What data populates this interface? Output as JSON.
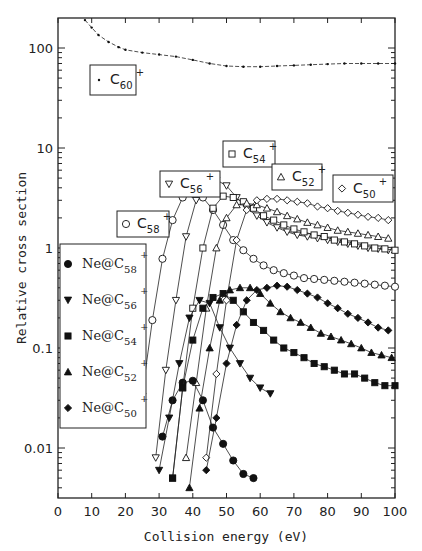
{
  "chart_data": {
    "type": "scatter",
    "title": "",
    "xlabel": "Collision energy (eV)",
    "ylabel": "Relative cross section",
    "xlim": [
      0,
      100
    ],
    "ylim": [
      0.003,
      200
    ],
    "yscale": "log",
    "grid": false,
    "x_ticks": [
      "0",
      "10",
      "20",
      "30",
      "40",
      "50",
      "60",
      "70",
      "80",
      "90",
      "100"
    ],
    "y_ticks": [
      "0.01",
      "0.1",
      "1",
      "10",
      "100"
    ],
    "series": [
      {
        "name": "C60+",
        "marker": "dot",
        "filled": true,
        "line": "dashed-then-solid",
        "x": [
          8,
          10,
          12,
          15,
          18,
          20,
          25,
          30,
          35,
          40,
          45,
          50,
          55,
          60,
          65,
          70,
          75,
          80,
          85,
          90,
          95,
          100
        ],
        "y": [
          190,
          160,
          135,
          115,
          102,
          96,
          90,
          86,
          82,
          76,
          70,
          66,
          65,
          65,
          66,
          67,
          68,
          69,
          70,
          70,
          70,
          70
        ]
      },
      {
        "name": "C58+",
        "marker": "circle",
        "filled": false,
        "x": [
          25,
          28,
          31,
          34,
          37,
          40,
          43,
          46,
          49,
          52,
          55,
          58,
          61,
          64,
          67,
          70,
          73,
          76,
          79,
          82,
          85,
          88,
          91,
          94,
          97,
          100
        ],
        "y": [
          0.035,
          0.19,
          0.78,
          1.9,
          3.2,
          3.5,
          3.2,
          2.4,
          1.7,
          1.2,
          0.95,
          0.78,
          0.67,
          0.6,
          0.56,
          0.53,
          0.5,
          0.49,
          0.48,
          0.47,
          0.46,
          0.45,
          0.44,
          0.43,
          0.42,
          0.41
        ]
      },
      {
        "name": "C56+",
        "marker": "triangle-down",
        "filled": false,
        "x": [
          29,
          32,
          35,
          38,
          41,
          44,
          47,
          50,
          53,
          56,
          59,
          62,
          65,
          68,
          71,
          74,
          77,
          80,
          83,
          86,
          89,
          92,
          95,
          98
        ],
        "y": [
          0.008,
          0.06,
          0.3,
          1.3,
          3.0,
          4.4,
          4.8,
          4.2,
          3.2,
          2.5,
          2.1,
          1.8,
          1.6,
          1.45,
          1.35,
          1.3,
          1.25,
          1.2,
          1.15,
          1.1,
          1.05,
          1.0,
          0.98,
          0.95
        ]
      },
      {
        "name": "C54+",
        "marker": "square",
        "filled": false,
        "x": [
          34,
          37,
          40,
          43,
          46,
          49,
          52,
          55,
          58,
          61,
          64,
          67,
          70,
          73,
          76,
          79,
          82,
          85,
          88,
          91,
          94,
          97,
          100
        ],
        "y": [
          0.005,
          0.04,
          0.25,
          1.0,
          2.5,
          3.3,
          3.2,
          2.9,
          2.5,
          2.1,
          1.9,
          1.7,
          1.55,
          1.45,
          1.35,
          1.3,
          1.2,
          1.15,
          1.1,
          1.05,
          1.0,
          0.98,
          0.95
        ]
      },
      {
        "name": "C52+",
        "marker": "triangle-up",
        "filled": false,
        "x": [
          38,
          41,
          44,
          47,
          50,
          53,
          56,
          59,
          62,
          65,
          68,
          71,
          74,
          77,
          80,
          83,
          86,
          89,
          92,
          95,
          98
        ],
        "y": [
          0.008,
          0.045,
          0.25,
          1.0,
          2.0,
          2.7,
          2.8,
          2.7,
          2.5,
          2.3,
          2.1,
          1.95,
          1.8,
          1.7,
          1.6,
          1.5,
          1.45,
          1.4,
          1.35,
          1.3,
          1.25
        ]
      },
      {
        "name": "C50+",
        "marker": "diamond",
        "filled": false,
        "x": [
          44,
          47,
          50,
          53,
          56,
          59,
          62,
          65,
          68,
          71,
          74,
          77,
          80,
          83,
          86,
          89,
          92,
          95,
          98
        ],
        "y": [
          0.008,
          0.055,
          0.3,
          1.2,
          2.4,
          3.0,
          3.1,
          3.1,
          3.0,
          2.9,
          2.8,
          2.6,
          2.5,
          2.35,
          2.25,
          2.15,
          2.05,
          2.0,
          1.9
        ]
      },
      {
        "name": "Ne@C58+",
        "marker": "circle",
        "filled": true,
        "x": [
          28,
          31,
          34,
          37,
          40,
          43,
          46,
          49,
          52,
          55,
          58
        ],
        "y": [
          0.003,
          0.013,
          0.03,
          0.045,
          0.047,
          0.03,
          0.016,
          0.011,
          0.0075,
          0.0055,
          0.005
        ]
      },
      {
        "name": "Ne@C56+",
        "marker": "triangle-down",
        "filled": true,
        "x": [
          30,
          33,
          36,
          39,
          42,
          45,
          48,
          51,
          54,
          57,
          60,
          63
        ],
        "y": [
          0.006,
          0.02,
          0.07,
          0.2,
          0.3,
          0.28,
          0.16,
          0.1,
          0.07,
          0.05,
          0.04,
          0.035
        ]
      },
      {
        "name": "Ne@C54+",
        "marker": "square",
        "filled": true,
        "x": [
          34,
          37,
          40,
          43,
          46,
          49,
          52,
          55,
          58,
          61,
          64,
          67,
          70,
          73,
          76,
          79,
          82,
          85,
          88,
          91,
          94,
          97,
          100
        ],
        "y": [
          0.005,
          0.04,
          0.12,
          0.25,
          0.32,
          0.35,
          0.3,
          0.23,
          0.18,
          0.15,
          0.12,
          0.1,
          0.09,
          0.08,
          0.07,
          0.065,
          0.06,
          0.055,
          0.055,
          0.05,
          0.045,
          0.042,
          0.042
        ]
      },
      {
        "name": "Ne@C52+",
        "marker": "triangle-up",
        "filled": true,
        "x": [
          39,
          42,
          45,
          48,
          51,
          54,
          57,
          60,
          63,
          66,
          69,
          72,
          75,
          78,
          81,
          84,
          87,
          90,
          93,
          96,
          99
        ],
        "y": [
          0.004,
          0.025,
          0.1,
          0.3,
          0.38,
          0.4,
          0.4,
          0.35,
          0.28,
          0.23,
          0.2,
          0.18,
          0.16,
          0.14,
          0.13,
          0.12,
          0.11,
          0.1,
          0.09,
          0.085,
          0.08
        ]
      },
      {
        "name": "Ne@C50+",
        "marker": "diamond",
        "filled": true,
        "x": [
          44,
          47,
          50,
          53,
          56,
          59,
          62,
          65,
          68,
          71,
          74,
          77,
          80,
          83,
          86,
          89,
          92,
          95,
          98
        ],
        "y": [
          0.006,
          0.02,
          0.07,
          0.17,
          0.3,
          0.38,
          0.4,
          0.42,
          0.41,
          0.38,
          0.35,
          0.32,
          0.28,
          0.25,
          0.22,
          0.2,
          0.18,
          0.16,
          0.15
        ]
      }
    ],
    "annotations": [
      {
        "text": "C60+",
        "box": true,
        "near": [
          12,
          55
        ]
      },
      {
        "text": "C58+",
        "box": true,
        "near": [
          22,
          2
        ]
      },
      {
        "text": "C56+",
        "box": true,
        "near": [
          42,
          9
        ]
      },
      {
        "text": "C54+",
        "box": true,
        "near": [
          56,
          10
        ]
      },
      {
        "text": "C52+",
        "box": true,
        "near": [
          70,
          6
        ]
      },
      {
        "text": "C50+",
        "box": true,
        "near": [
          88,
          4
        ]
      }
    ],
    "legend": {
      "position": "left-middle",
      "entries": [
        "Ne@C58+",
        "Ne@C56+",
        "Ne@C54+",
        "Ne@C52+",
        "Ne@C50+"
      ]
    }
  },
  "labels": {
    "xlabel": "Collision energy (eV)",
    "ylabel": "Relative cross section",
    "boxes": [
      {
        "base": "C",
        "sub": "60",
        "sup": "+",
        "marker": "dot"
      },
      {
        "base": "C",
        "sub": "58",
        "sup": "+",
        "marker": "circle"
      },
      {
        "base": "C",
        "sub": "56",
        "sup": "+",
        "marker": "triangle-down"
      },
      {
        "base": "C",
        "sub": "54",
        "sup": "+",
        "marker": "square"
      },
      {
        "base": "C",
        "sub": "52",
        "sup": "+",
        "marker": "triangle-up"
      },
      {
        "base": "C",
        "sub": "50",
        "sup": "+",
        "marker": "diamond"
      }
    ],
    "legend": [
      {
        "base": "Ne@C",
        "sub": "58",
        "sup": "+"
      },
      {
        "base": "Ne@C",
        "sub": "56",
        "sup": "+"
      },
      {
        "base": "Ne@C",
        "sub": "54",
        "sup": "+"
      },
      {
        "base": "Ne@C",
        "sub": "52",
        "sup": "+"
      },
      {
        "base": "Ne@C",
        "sub": "50",
        "sup": "+"
      }
    ]
  }
}
